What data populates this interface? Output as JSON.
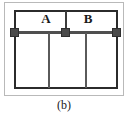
{
  "figure": {
    "caption": "(b)",
    "outer_frame_name": "outer-frame",
    "panel_name": "structural-panel",
    "labels": [
      {
        "id": "A",
        "text": "A"
      },
      {
        "id": "B",
        "text": "B"
      }
    ],
    "nodes": [
      {
        "id": "left",
        "text": ""
      },
      {
        "id": "middle",
        "text": ""
      },
      {
        "id": "right",
        "text": ""
      }
    ],
    "members": {
      "beam_text": "",
      "stub_text": "",
      "post_1_text": "",
      "post_2_text": ""
    },
    "colors": {
      "outer_frame_stroke": "#b9b9b9",
      "panel_stroke": "#2b2b2b",
      "beam_stroke": "#4f4f4f",
      "node_fill": "#4a4a4a",
      "node_stroke": "#2f2f2f",
      "post_stroke": "#5a5a5a",
      "text": "#1a1a1a",
      "background": "#ffffff"
    }
  },
  "chart_data": {
    "type": "diagram",
    "title": "(b)",
    "annotations": [
      "A",
      "B",
      "(b)"
    ],
    "bays": [
      {
        "label": "A",
        "position": "left-of-centre-node"
      },
      {
        "label": "B",
        "position": "right-of-centre-node"
      }
    ],
    "node_count": 3,
    "post_count": 2,
    "beam_count": 1
  }
}
